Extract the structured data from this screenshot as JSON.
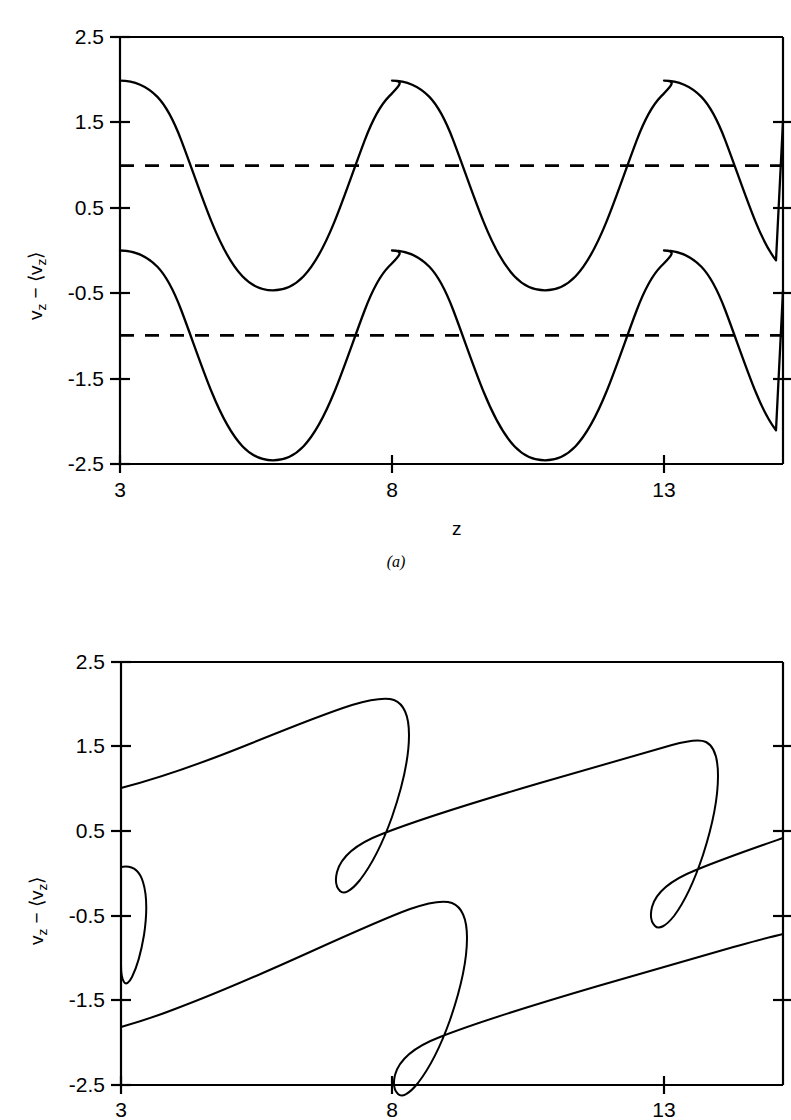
{
  "figure": {
    "running_head": "",
    "background_color": "#ffffff",
    "ink_color": "#000000"
  },
  "axis": {
    "y_label_prefix": "v",
    "y_label_sub1": "z",
    "y_label_mid": " − ⟨v",
    "y_label_sub2": "z",
    "y_label_suffix": "⟩",
    "y_label_plain": "vz − ⟨vz⟩",
    "x_label": "z",
    "y_ticks": [
      "2.5",
      "1.5",
      "0.5",
      "-0.5",
      "-1.5",
      "-2.5"
    ],
    "x_ticks": [
      "3",
      "8",
      "13"
    ]
  },
  "panels": [
    {
      "caption": "(a)",
      "id": "panel-a"
    },
    {
      "caption": "",
      "id": "panel-b"
    }
  ],
  "chart_data": [
    {
      "type": "line",
      "title": "",
      "subtitle": "(a)",
      "xlabel": "z",
      "ylabel": "vz - <vz>",
      "xlim": [
        3,
        15.15
      ],
      "ylim": [
        -2.5,
        2.5
      ],
      "xticks": [
        3,
        8,
        13
      ],
      "yticks": [
        2.5,
        1.5,
        0.5,
        -0.5,
        -1.5,
        -2.5
      ],
      "grid": false,
      "legend": "none",
      "description": "Two sinusoidal velocity profiles, upper offset +1.0 and lower offset -1.0, each of amplitude about 1.0 and wavelength about 5 in z; horizontal dashed reference lines mark the two offsets.",
      "series": [
        {
          "name": "upper wave",
          "style": "solid",
          "form": "sine",
          "offset": 1.0,
          "amplitude": 1.0,
          "wavelength": 5.0,
          "phase_deg": 90,
          "x": [
            3.0,
            3.5,
            4.0,
            4.5,
            5.0,
            5.5,
            6.0,
            6.5,
            7.0,
            7.5,
            8.0,
            8.5,
            9.0,
            9.5,
            10.0,
            10.5,
            11.0,
            11.5,
            12.0,
            12.5,
            13.0,
            13.5,
            14.0,
            14.5,
            15.15
          ],
          "y": [
            2.0,
            1.81,
            1.31,
            0.69,
            0.19,
            0.0,
            0.19,
            0.69,
            1.31,
            1.81,
            2.0,
            1.81,
            1.31,
            0.69,
            0.19,
            0.0,
            0.19,
            0.69,
            1.31,
            1.81,
            2.0,
            1.81,
            1.31,
            0.69,
            0.22
          ]
        },
        {
          "name": "lower wave",
          "style": "solid",
          "form": "sine",
          "offset": -1.0,
          "amplitude": 1.0,
          "wavelength": 5.0,
          "phase_deg": 90,
          "x": [
            3.0,
            3.5,
            4.0,
            4.5,
            5.0,
            5.5,
            6.0,
            6.5,
            7.0,
            7.5,
            8.0,
            8.5,
            9.0,
            9.5,
            10.0,
            10.5,
            11.0,
            11.5,
            12.0,
            12.5,
            13.0,
            13.5,
            14.0,
            14.5,
            15.15
          ],
          "y": [
            0.0,
            -0.19,
            -0.69,
            -1.31,
            -1.81,
            -2.0,
            -1.81,
            -1.31,
            -0.69,
            -0.19,
            0.0,
            -0.19,
            -0.69,
            -1.31,
            -1.81,
            -2.0,
            -1.81,
            -1.31,
            -0.69,
            -0.19,
            0.0,
            -0.19,
            -0.69,
            -1.31,
            -1.78
          ]
        },
        {
          "name": "upper reference level",
          "style": "dashed",
          "form": "horizontal",
          "y_value": 1.0
        },
        {
          "name": "lower reference level",
          "style": "dashed",
          "form": "horizontal",
          "y_value": -1.0
        }
      ]
    },
    {
      "type": "line",
      "title": "",
      "subtitle": "(b)",
      "xlabel": "z",
      "ylabel": "vz - <vz>",
      "xlim": [
        3,
        15.15
      ],
      "ylim": [
        -2.5,
        2.5
      ],
      "xticks": [
        3,
        8,
        13
      ],
      "yticks": [
        2.5,
        1.5,
        0.5,
        -0.5,
        -1.5,
        -2.5
      ],
      "grid": false,
      "legend": "none",
      "description": "The same two wave profiles after nonlinear steepening: each crest has overturned so the curve is multivalued in z, producing S-shaped folds; a small closed fold appears at the left edge of the lower branch.",
      "series": [
        {
          "name": "upper overturned wave",
          "style": "solid",
          "form": "multivalued-fold",
          "offset": 1.0,
          "amplitude": 1.0,
          "wavelength": 5.0,
          "folds": 2,
          "y_max": 2.0,
          "y_min": 0.18
        },
        {
          "name": "lower overturned wave",
          "style": "solid",
          "form": "multivalued-fold",
          "offset": -1.0,
          "amplitude": 1.0,
          "wavelength": 5.0,
          "folds": 2,
          "y_max": -0.2,
          "y_min": -2.05
        }
      ]
    }
  ]
}
